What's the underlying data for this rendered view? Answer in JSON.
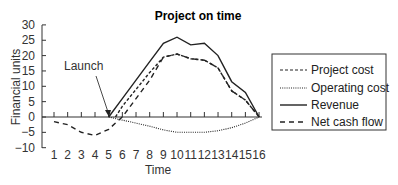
{
  "chart_data": {
    "type": "line",
    "title": "Project on time",
    "xlabel": "Time",
    "ylabel": "Financial units",
    "x": [
      1,
      2,
      3,
      4,
      5,
      6,
      7,
      8,
      9,
      10,
      11,
      12,
      13,
      14,
      15,
      16
    ],
    "ylim": [
      -10,
      30
    ],
    "xlim": [
      1,
      16
    ],
    "yticks": [
      -10,
      -5,
      0,
      5,
      10,
      15,
      20,
      25,
      30
    ],
    "xticks": [
      1,
      2,
      3,
      4,
      5,
      6,
      7,
      8,
      9,
      10,
      11,
      12,
      13,
      14,
      15,
      16
    ],
    "grid": false,
    "legend_position": "right",
    "annotations": [
      {
        "text": "Launch",
        "x": 5,
        "y": 0
      }
    ],
    "series": [
      {
        "name": "Project cost",
        "style": "short-dash",
        "x": [
          5.5,
          6,
          7,
          8,
          9,
          10,
          11,
          12,
          13,
          14,
          15,
          16
        ],
        "values": [
          0,
          3.5,
          9,
          14.5,
          19.5,
          20.5,
          19,
          18.5,
          16,
          8.5,
          5.5,
          0
        ]
      },
      {
        "name": "Operating cost",
        "style": "dotted",
        "x": [
          5,
          6,
          7,
          8,
          9,
          10,
          11,
          12,
          13,
          14,
          15,
          16
        ],
        "values": [
          0,
          -1,
          -2,
          -3,
          -4.2,
          -5,
          -5,
          -5,
          -4.5,
          -3.5,
          -2,
          0
        ]
      },
      {
        "name": "Revenue",
        "style": "solid",
        "x": [
          5,
          6,
          7,
          8,
          9,
          10,
          11,
          12,
          13,
          14,
          15,
          16
        ],
        "values": [
          0,
          6,
          12,
          18,
          24,
          26,
          23.5,
          24,
          20,
          11.5,
          8,
          0
        ]
      },
      {
        "name": "Net cash flow",
        "style": "long-dash",
        "x": [
          1,
          2,
          3,
          4,
          5,
          5.5,
          6,
          7,
          8,
          9,
          10,
          11,
          12,
          13,
          14,
          15,
          16
        ],
        "values": [
          -1.5,
          -2.5,
          -5,
          -6,
          -4,
          -2,
          0,
          6,
          12,
          19.5,
          20.5,
          19,
          18.5,
          16,
          8.5,
          5.5,
          0
        ]
      }
    ]
  },
  "legend": {
    "items": [
      {
        "label": "Project cost"
      },
      {
        "label": "Operating cost"
      },
      {
        "label": "Revenue"
      },
      {
        "label": "Net cash flow"
      }
    ]
  }
}
